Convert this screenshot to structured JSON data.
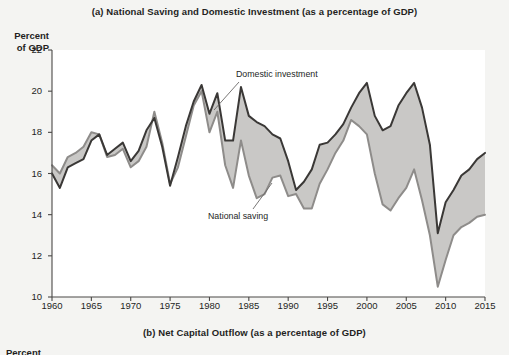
{
  "figure": {
    "panel_a_title": "(a) National Saving and Domestic Investment (as a percentage of GDP)",
    "panel_b_title": "(b) Net Capital Outflow (as a percentage of GDP)",
    "y_axis_caption_line1": "Percent",
    "y_axis_caption_line2": "of GDP",
    "panel_b_axis_caption_partial": "Percent"
  },
  "annotations": {
    "domestic_investment": "Domestic investment",
    "national_saving": "National saving"
  },
  "colors": {
    "investment_line": "#3a3836",
    "saving_line": "#8e8c8a",
    "gap_fill": "#c9c8c6",
    "axis": "#4a4846",
    "page_background": "#f4f4f2",
    "plot_background": "#ffffff",
    "text": "#241f1e"
  },
  "chart_data": {
    "type": "line",
    "title": "(a) National Saving and Domestic Investment (as a percentage of GDP)",
    "xlabel": "",
    "ylabel": "Percent of GDP",
    "xlim": [
      1960,
      2015
    ],
    "ylim": [
      10,
      22
    ],
    "yticks": [
      10,
      12,
      14,
      16,
      18,
      20,
      22
    ],
    "xticks": [
      1960,
      1965,
      1970,
      1975,
      1980,
      1985,
      1990,
      1995,
      2000,
      2005,
      2010,
      2015
    ],
    "grid": false,
    "legend": "annotated-inline",
    "x": [
      1960,
      1961,
      1962,
      1963,
      1964,
      1965,
      1966,
      1967,
      1968,
      1969,
      1970,
      1971,
      1972,
      1973,
      1974,
      1975,
      1976,
      1977,
      1978,
      1979,
      1980,
      1981,
      1982,
      1983,
      1984,
      1985,
      1986,
      1987,
      1988,
      1989,
      1990,
      1991,
      1992,
      1993,
      1994,
      1995,
      1996,
      1997,
      1998,
      1999,
      2000,
      2001,
      2002,
      2003,
      2004,
      2005,
      2006,
      2007,
      2008,
      2009,
      2010,
      2011,
      2012,
      2013,
      2014,
      2015
    ],
    "series": [
      {
        "name": "Domestic investment",
        "color": "#3a3836",
        "values": [
          16.0,
          15.3,
          16.3,
          16.5,
          16.7,
          17.6,
          17.9,
          16.9,
          17.2,
          17.5,
          16.6,
          17.1,
          18.1,
          18.7,
          17.3,
          15.4,
          16.8,
          18.3,
          19.5,
          20.3,
          18.9,
          19.9,
          17.6,
          17.6,
          20.2,
          18.8,
          18.5,
          18.3,
          17.9,
          17.7,
          16.6,
          15.2,
          15.6,
          16.2,
          17.4,
          17.5,
          17.9,
          18.4,
          19.2,
          19.9,
          20.4,
          18.8,
          18.1,
          18.3,
          19.3,
          19.9,
          20.4,
          19.2,
          17.4,
          13.1,
          14.6,
          15.2,
          15.9,
          16.2,
          16.7,
          17.0
        ]
      },
      {
        "name": "National saving",
        "color": "#8e8c8a",
        "values": [
          16.4,
          16.0,
          16.8,
          17.0,
          17.3,
          18.0,
          17.9,
          16.8,
          16.9,
          17.2,
          16.3,
          16.6,
          17.3,
          19.0,
          17.5,
          15.5,
          16.3,
          17.8,
          19.3,
          20.0,
          18.0,
          19.0,
          16.4,
          15.3,
          17.6,
          15.9,
          14.8,
          15.0,
          15.8,
          15.9,
          14.9,
          15.0,
          14.3,
          14.3,
          15.5,
          16.2,
          17.0,
          17.6,
          18.6,
          18.3,
          17.9,
          16.0,
          14.5,
          14.2,
          14.8,
          15.3,
          16.2,
          14.7,
          13.0,
          10.5,
          11.8,
          13.0,
          13.4,
          13.6,
          13.9,
          14.0
        ]
      }
    ]
  }
}
